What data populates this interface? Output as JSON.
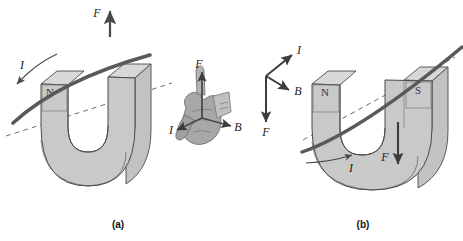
{
  "figure": {
    "background_color": "#ffffff",
    "magnet_fill": "#c9c9c9",
    "magnet_fill_light": "#d8d8d8",
    "magnet_fill_dark": "#b4b4b4",
    "outline_color": "#4a4a4a",
    "wire_color": "#5a5a5a",
    "arrow_color": "#3c3c3c",
    "dash_color": "#6e6e6e",
    "hand_color": "#8c8c8c"
  },
  "panels": [
    {
      "id": "a",
      "caption": "(a)",
      "caption_x": 118,
      "caption_y": 228,
      "poles": [
        {
          "label": "N",
          "x": 50,
          "y": 96
        }
      ],
      "vectors": [
        {
          "symbol": "F",
          "x": 95,
          "y": 17,
          "direction": "up"
        },
        {
          "symbol": "I",
          "x": 22,
          "y": 69,
          "direction": "down-left"
        }
      ]
    },
    {
      "id": "b",
      "caption": "(b)",
      "caption_x": 363,
      "caption_y": 228,
      "poles": [
        {
          "label": "N",
          "x": 327,
          "y": 96
        },
        {
          "label": "S",
          "x": 420,
          "y": 94
        }
      ],
      "vectors": [
        {
          "symbol": "I",
          "x": 290,
          "y": 55,
          "direction": "up-right"
        },
        {
          "symbol": "B",
          "x": 290,
          "y": 93,
          "direction": "down-right"
        },
        {
          "symbol": "F",
          "x": 250,
          "y": 133,
          "direction": "down"
        },
        {
          "symbol": "I",
          "x": 352,
          "y": 163,
          "direction": "right-along-wire"
        },
        {
          "symbol": "F",
          "x": 387,
          "y": 158,
          "direction": "down"
        }
      ]
    }
  ],
  "hand_diagram": {
    "id": "right-hand",
    "description": "Right hand showing three mutually perpendicular vectors",
    "vectors": [
      {
        "symbol": "F",
        "x": 199,
        "y": 66,
        "direction": "up"
      },
      {
        "symbol": "I",
        "x": 172,
        "y": 133,
        "direction": "down-left"
      },
      {
        "symbol": "B",
        "x": 237,
        "y": 129,
        "direction": "down-right"
      }
    ]
  }
}
